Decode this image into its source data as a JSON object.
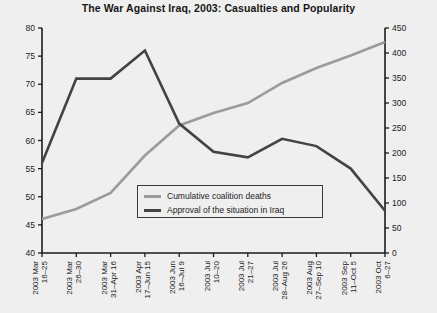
{
  "chart_data": {
    "type": "line",
    "title": "The War Against Iraq, 2003: Casualties and Popularity",
    "xlabel": "",
    "ylabel": "",
    "grid": false,
    "legend_position": "inside-bottom-center",
    "categories": [
      "2003 Mar 16–25",
      "2003 Mar 26–30",
      "2003 Mar 31–Apr 16",
      "2003 Apr 17–Jun 15",
      "2003 Jun 16–Jul 9",
      "2003 Jul 10–20",
      "2003 Jul 21–27",
      "2003 Jul 28–Aug 26",
      "2003 Aug 27–Sep 10",
      "2003 Sep 11–Oct 5",
      "2003 Oct 6–27"
    ],
    "x_tick_lines": [
      [
        "2003 Mar",
        "16–25"
      ],
      [
        "2003 Mar",
        "26–30"
      ],
      [
        "2003 Mar",
        "31–Apr 16"
      ],
      [
        "2003 Apr",
        "17–Jun 15"
      ],
      [
        "2003 Jun",
        "16–Jul 9"
      ],
      [
        "2003 Jul",
        "10–20"
      ],
      [
        "2003 Jul",
        "21–27"
      ],
      [
        "2003 Jul",
        "28–Aug 26"
      ],
      [
        "2003 Aug",
        "27–Sep 10"
      ],
      [
        "2003 Sep",
        "11–Oct 5"
      ],
      [
        "2003 Oct",
        "6–27"
      ]
    ],
    "left_axis": {
      "label": "",
      "ylim": [
        40,
        80
      ],
      "ticks": [
        40,
        45,
        50,
        55,
        60,
        65,
        70,
        75,
        80
      ]
    },
    "right_axis": {
      "label": "",
      "ylim": [
        0,
        450
      ],
      "ticks": [
        0,
        50,
        100,
        150,
        200,
        250,
        300,
        350,
        400,
        450
      ]
    },
    "series": [
      {
        "name": "Cumulative coalition deaths",
        "axis": "right",
        "color": "#9b9b9b",
        "values": [
          68,
          88,
          120,
          195,
          255,
          280,
          300,
          340,
          370,
          395,
          422
        ]
      },
      {
        "name": "Approval of the situation in Iraq",
        "axis": "left",
        "color": "#434343",
        "values": [
          56,
          71,
          71,
          76,
          63,
          58,
          57,
          60.3,
          59,
          55,
          47.5
        ]
      }
    ]
  },
  "legend": {
    "items": [
      {
        "label": "Cumulative coalition deaths",
        "swatch": "gray"
      },
      {
        "label": "Approval of the situation in Iraq",
        "swatch": "dark"
      }
    ]
  },
  "colors": {
    "background": "#efefef",
    "axis": "#1b1b1b",
    "series_gray": "#9b9b9b",
    "series_dark": "#434343"
  }
}
